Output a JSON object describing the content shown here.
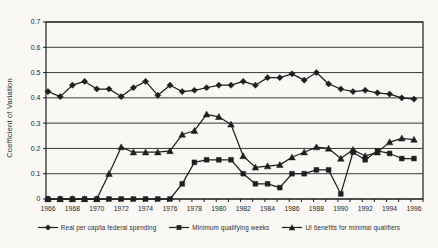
{
  "figure": {
    "background": "#f9f8f5"
  },
  "chart_data": {
    "type": "line",
    "title": "",
    "xlabel": "",
    "ylabel": "Coefficient of Variation",
    "ylim": [
      0,
      0.7
    ],
    "ytick_labels": [
      "0",
      "0.1",
      "0.2",
      "0.3",
      "0.4",
      "0.5",
      "0.6",
      "0.7"
    ],
    "grid": "horizontal",
    "legend_position": "bottom",
    "x": [
      1966,
      1967,
      1968,
      1969,
      1970,
      1971,
      1972,
      1973,
      1974,
      1975,
      1976,
      1977,
      1978,
      1979,
      1980,
      1981,
      1982,
      1983,
      1984,
      1985,
      1986,
      1987,
      1988,
      1989,
      1990,
      1991,
      1992,
      1993,
      1994,
      1995,
      1996
    ],
    "xtick_labels": [
      "1966",
      "1968",
      "1970",
      "1972",
      "1974",
      "1976",
      "1978",
      "1980",
      "1982",
      "1984",
      "1986",
      "1988",
      "1990",
      "1992",
      "1994",
      "1996"
    ],
    "series": [
      {
        "name": "Real per capita federal spending",
        "marker": "diamond",
        "values": [
          0.425,
          0.405,
          0.45,
          0.465,
          0.435,
          0.435,
          0.405,
          0.44,
          0.465,
          0.41,
          0.45,
          0.425,
          0.43,
          0.44,
          0.45,
          0.45,
          0.465,
          0.45,
          0.48,
          0.48,
          0.495,
          0.47,
          0.5,
          0.455,
          0.435,
          0.425,
          0.43,
          0.42,
          0.415,
          0.4,
          0.395
        ]
      },
      {
        "name": "Minimum qualifying weeks",
        "marker": "square",
        "values": [
          0,
          0,
          0,
          0,
          0,
          0,
          0,
          0,
          0,
          0,
          0,
          0.06,
          0.145,
          0.155,
          0.155,
          0.155,
          0.1,
          0.06,
          0.06,
          0.045,
          0.1,
          0.1,
          0.115,
          0.115,
          0.02,
          0.185,
          0.155,
          0.19,
          0.18,
          0.16,
          0.16
        ]
      },
      {
        "name": "UI benefits for minimal qualifiers",
        "marker": "triangle",
        "values": [
          0,
          0,
          0,
          0,
          0,
          0.1,
          0.205,
          0.185,
          0.185,
          0.185,
          0.19,
          0.255,
          0.27,
          0.335,
          0.325,
          0.295,
          0.17,
          0.125,
          0.13,
          0.135,
          0.165,
          0.185,
          0.205,
          0.2,
          0.16,
          0.195,
          0.17,
          0.185,
          0.225,
          0.24,
          0.235
        ]
      }
    ],
    "colors": {
      "ink": "#1f1f1f",
      "grid": "#3a3a3a",
      "background": "#f9f8f5"
    }
  }
}
